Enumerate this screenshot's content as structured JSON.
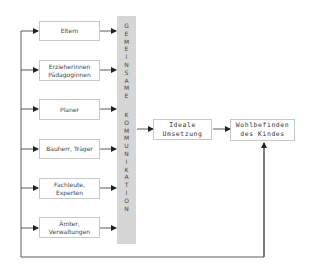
{
  "diagram": {
    "sources": [
      {
        "label_lines": [
          "Eltern"
        ]
      },
      {
        "label_lines": [
          "Erzieherinnen",
          "Pädagoginnen"
        ]
      },
      {
        "label_lines": [
          "Planer"
        ]
      },
      {
        "label_lines": [
          "Bauherr, Träger"
        ]
      },
      {
        "label_lines": [
          "Fachleute,",
          "Experten"
        ]
      },
      {
        "label_lines": [
          "Ämter,",
          "Verwaltungen"
        ]
      }
    ],
    "band": {
      "word1": "GEMEINSAME",
      "word2": "KOMMUNIKATION",
      "color": "#d6d6d6"
    },
    "middle": {
      "line1": "Ideale",
      "line2": "Umsetzung"
    },
    "target": {
      "line1": "Wohlbefinden",
      "line2": "des Kindes"
    },
    "colors": {
      "line": "#333333",
      "box_border": "#c8c8c8"
    }
  }
}
